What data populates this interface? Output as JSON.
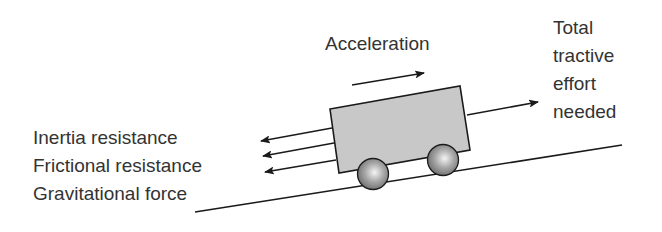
{
  "diagram": {
    "title": "",
    "labels": {
      "acceleration": "Acceleration",
      "tractive_1": "Total",
      "tractive_2": "tractive",
      "tractive_3": "effort",
      "tractive_4": "needed",
      "inertia": "Inertia resistance",
      "frictional": "Frictional resistance",
      "gravitational": "Gravitational force"
    },
    "colors": {
      "stroke": "#1a1a1a",
      "box_fill": "#c8c8c8",
      "wheel_fill": "#9a9a9a",
      "text": "#333333"
    }
  }
}
